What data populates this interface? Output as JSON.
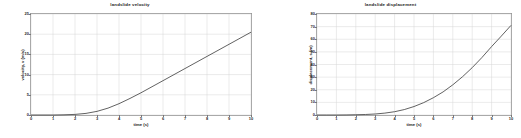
{
  "figure": {
    "background_color": "#ffffff",
    "axis_color": "#9a9a9a",
    "grid_color": "#d6d6d6",
    "curve_color": "#3a3a3a"
  },
  "charts": [
    {
      "id": "landslide-velocity",
      "title": "landslide velocity",
      "xlabel": "time (s)",
      "ylabel": "velocity, v (m/s)",
      "xticks": [
        "0",
        "1",
        "2",
        "3",
        "4",
        "5",
        "6",
        "7",
        "8",
        "9",
        "10"
      ],
      "yticks": [
        "0",
        "5",
        "10",
        "15",
        "20",
        "25"
      ]
    },
    {
      "id": "landslide-displacement",
      "title": "landslide displacement",
      "xlabel": "time (s)",
      "ylabel": "displacement, s (m)",
      "xticks": [
        "0",
        "1",
        "2",
        "3",
        "4",
        "5",
        "6",
        "7",
        "8",
        "9",
        "10"
      ],
      "yticks": [
        "0",
        "10",
        "20",
        "30",
        "40",
        "50",
        "60",
        "70",
        "80"
      ]
    }
  ],
  "chart_data": [
    {
      "type": "line",
      "title": "landslide velocity",
      "xlabel": "time (s)",
      "ylabel": "velocity, v (m/s)",
      "xlim": [
        0,
        10
      ],
      "ylim": [
        0,
        25
      ],
      "xticks": [
        0,
        1,
        2,
        3,
        4,
        5,
        6,
        7,
        8,
        9,
        10
      ],
      "yticks": [
        0,
        5,
        10,
        15,
        20,
        25
      ],
      "grid": true,
      "legend": null,
      "x": [
        0,
        0.5,
        1,
        1.5,
        2,
        2.5,
        3,
        3.5,
        4,
        4.5,
        5,
        5.5,
        6,
        6.5,
        7,
        7.5,
        8,
        8.5,
        9,
        9.5,
        10
      ],
      "y": [
        0,
        0,
        0,
        0.05,
        0.15,
        0.4,
        0.9,
        1.7,
        2.8,
        4.1,
        5.5,
        7.0,
        8.5,
        10.0,
        11.5,
        13.0,
        14.5,
        16.0,
        17.5,
        19.0,
        20.5
      ]
    },
    {
      "type": "line",
      "title": "landslide displacement",
      "xlabel": "time (s)",
      "ylabel": "displacement, s (m)",
      "xlim": [
        0,
        10
      ],
      "ylim": [
        0,
        80
      ],
      "xticks": [
        0,
        1,
        2,
        3,
        4,
        5,
        6,
        7,
        8,
        9,
        10
      ],
      "yticks": [
        0,
        10,
        20,
        30,
        40,
        50,
        60,
        70,
        80
      ],
      "grid": true,
      "legend": null,
      "x": [
        0,
        0.5,
        1,
        1.5,
        2,
        2.5,
        3,
        3.5,
        4,
        4.5,
        5,
        5.5,
        6,
        6.5,
        7,
        7.5,
        8,
        8.5,
        9,
        9.5,
        10
      ],
      "y": [
        0,
        0,
        0,
        0.05,
        0.2,
        0.4,
        0.8,
        1.5,
        2.6,
        4.3,
        6.7,
        9.8,
        13.7,
        18.3,
        23.9,
        30.3,
        37.5,
        45.5,
        54.2,
        62.5,
        71.0
      ]
    }
  ]
}
